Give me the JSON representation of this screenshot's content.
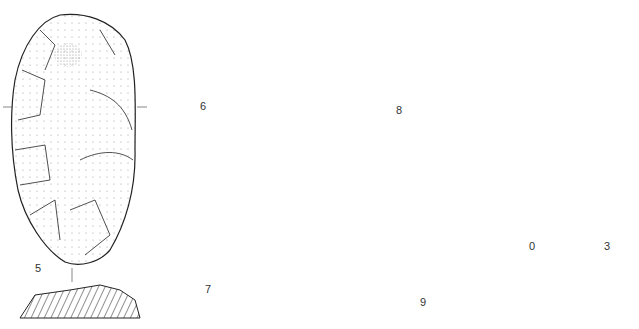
{
  "figure": {
    "type": "archaeological lithic illustration plate",
    "artifacts": [
      {
        "id": "5",
        "label": "5",
        "description": "elongated bifacially flaked flint tool with hatched cross-section below"
      },
      {
        "id": "6",
        "label": "6",
        "description": "flake with cortex stippling and retouched edges"
      },
      {
        "id": "7",
        "label": "7",
        "description": "rounded retouched flake with profile below"
      },
      {
        "id": "8",
        "label": "8",
        "description": "large oval retouched flake with side profile"
      },
      {
        "id": "9",
        "label": "9",
        "description": "small blade fragment with side view and section"
      }
    ],
    "scale_bar": {
      "start_label": "0",
      "end_label": "3"
    }
  },
  "colors": {
    "line": "#222222",
    "stipple": "#888888",
    "background": "#ffffff"
  }
}
